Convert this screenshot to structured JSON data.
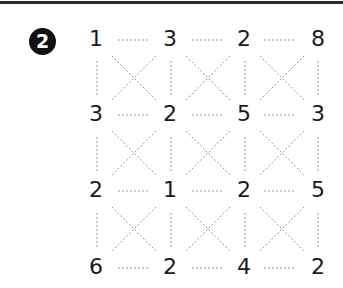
{
  "problem": {
    "badge_number": "2",
    "grid": [
      [
        "1",
        "3",
        "2",
        "8"
      ],
      [
        "3",
        "2",
        "5",
        "3"
      ],
      [
        "2",
        "1",
        "2",
        "5"
      ],
      [
        "6",
        "2",
        "4",
        "2"
      ]
    ]
  },
  "colors": {
    "badge_bg": "#111111",
    "badge_text": "#ffffff",
    "number_text": "#1a1a1a",
    "dotted_line": "#9a9a9a",
    "top_rule": "#2a2a2a"
  }
}
